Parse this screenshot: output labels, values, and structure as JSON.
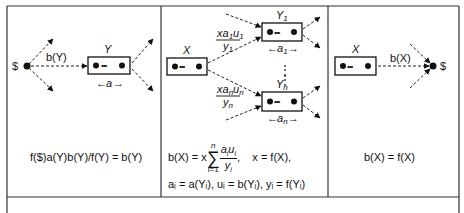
{
  "panels": [
    {
      "id": "left",
      "source_label": "$",
      "edge_label": "b(Y)",
      "node_label": "Y",
      "width_label": "a",
      "equation": "f($)a(Y)b(Y)/f(Y) = b(Y)"
    },
    {
      "id": "middle",
      "source_node_label": "X",
      "targets": [
        {
          "node_label": "Y",
          "sub": "1",
          "width_label": "a",
          "width_sub": "1",
          "frac_num": "xa",
          "frac_num_sub1": "1",
          "frac_num_u": "u",
          "frac_num_sub2": "1",
          "frac_den": "y",
          "frac_den_sub": "1"
        },
        {
          "node_label": "Y",
          "sub": "n",
          "width_label": "a",
          "width_sub": "n",
          "frac_num": "xa",
          "frac_num_sub1": "n",
          "frac_num_u": "u",
          "frac_num_sub2": "n",
          "frac_den": "y",
          "frac_den_sub": "n"
        }
      ],
      "ellipsis": "⋮",
      "equation_line1": {
        "lhs": "b(X) = x",
        "sum_top": "n",
        "sum_bottom": "i=1",
        "sum_symbol": "∑",
        "num": "a",
        "num_u": "u",
        "den": "y",
        "index": "i",
        "tail": ",    x = f(X),"
      },
      "equation_line2": "aᵢ = a(Yᵢ), uᵢ = b(Yᵢ), yᵢ = f(Yᵢ)"
    },
    {
      "id": "right",
      "node_label": "X",
      "edge_label": "b(X)",
      "sink_label": "$",
      "equation": "b(X) = f(X)"
    }
  ],
  "glyphs": {
    "dots": "•••",
    "arrow_left": "←",
    "arrow_right": "→"
  }
}
